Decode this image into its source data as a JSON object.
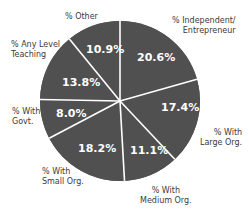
{
  "chart_data": {
    "type": "pie",
    "title": "",
    "start_angle_deg": 0,
    "direction": "clockwise",
    "slice_color": "#505050",
    "separator_color": "#ffffff",
    "categories": [
      "% Independent/ Entrepreneur",
      "% With Large Org.",
      "% With Medium Org.",
      "% With Small Org.",
      "% With Govt.",
      "% Any Level Teaching",
      "% Other"
    ],
    "values": [
      20.6,
      17.4,
      11.1,
      18.2,
      8.0,
      13.8,
      10.9
    ],
    "value_labels": [
      "20.6%",
      "17.4%",
      "11.1%",
      "18.2%",
      "8.0%",
      "13.8%",
      "10.9%"
    ]
  },
  "labels": {
    "independent": "% Independent/\nEntrepreneur",
    "large": "% With\nLarge Org.",
    "medium": "% With\nMedium Org.",
    "small": "% With\nSmall Org.",
    "govt": "% With\nGovt.",
    "teaching": "% Any Level\nTeaching",
    "other": "% Other"
  },
  "values": {
    "independent": "20.6%",
    "large": "17.4%",
    "medium": "11.1%",
    "small": "18.2%",
    "govt": "8.0%",
    "teaching": "13.8%",
    "other": "10.9%"
  }
}
